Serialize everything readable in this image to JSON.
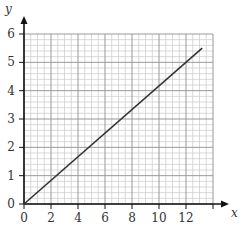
{
  "chart_data": {
    "type": "line",
    "title": "",
    "xlabel": "x",
    "ylabel": "y",
    "xlim": [
      0,
      14
    ],
    "ylim": [
      0,
      6
    ],
    "x_ticks": [
      0,
      2,
      4,
      6,
      8,
      10,
      12
    ],
    "y_ticks": [
      0,
      1,
      2,
      3,
      4,
      5,
      6
    ],
    "x_minor_step": 0.5,
    "y_minor_step": 0.2,
    "grid": true,
    "legend": null,
    "series": [
      {
        "name": "line",
        "color": "#333333",
        "x": [
          0,
          13.2
        ],
        "y": [
          0,
          5.5
        ]
      }
    ]
  },
  "colors": {
    "axis": "#111111",
    "major_grid": "#999999",
    "minor_grid": "#cfcfcf",
    "line": "#333333"
  }
}
